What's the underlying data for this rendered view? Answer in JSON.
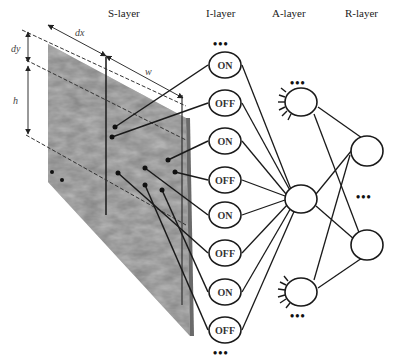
{
  "layers": {
    "s": {
      "title": "S-layer"
    },
    "i": {
      "title": "I-layer"
    },
    "a": {
      "title": "A-layer"
    },
    "r": {
      "title": "R-layer"
    }
  },
  "dimensions": {
    "dx": "dx",
    "dy": "dy",
    "w": "w",
    "h": "h"
  },
  "i_nodes": [
    "ON",
    "OFF",
    "ON",
    "OFF",
    "ON",
    "OFF",
    "ON",
    "OFF"
  ],
  "ellipsis": "•••",
  "colors": {
    "line": "#1a1a1a",
    "texture_dark": "#555555",
    "texture_light": "#b8b8b8"
  }
}
